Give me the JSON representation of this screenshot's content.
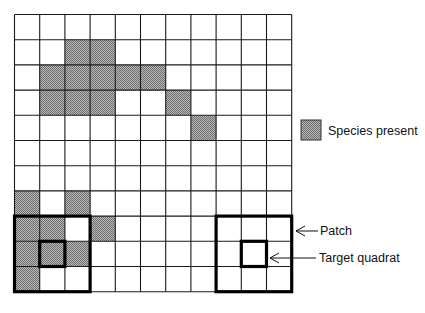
{
  "grid": {
    "rows": 11,
    "cols": 11,
    "line_color": "#1a1a1a",
    "shade_color": "#9a9a9a",
    "shaded_cells": [
      [
        1,
        2
      ],
      [
        1,
        3
      ],
      [
        2,
        1
      ],
      [
        2,
        2
      ],
      [
        2,
        3
      ],
      [
        2,
        4
      ],
      [
        2,
        5
      ],
      [
        3,
        1
      ],
      [
        3,
        2
      ],
      [
        3,
        3
      ],
      [
        3,
        6
      ],
      [
        4,
        7
      ],
      [
        7,
        0
      ],
      [
        7,
        2
      ],
      [
        8,
        0
      ],
      [
        8,
        1
      ],
      [
        8,
        3
      ],
      [
        9,
        0
      ],
      [
        9,
        1
      ],
      [
        9,
        2
      ],
      [
        10,
        0
      ]
    ]
  },
  "patches": [
    {
      "name": "left",
      "rows": [
        8,
        10
      ],
      "cols": [
        0,
        2
      ],
      "target": [
        9,
        1
      ]
    },
    {
      "name": "right",
      "rows": [
        8,
        10
      ],
      "cols": [
        8,
        10
      ],
      "target": [
        9,
        9
      ]
    }
  ],
  "legend": {
    "label": "Species present"
  },
  "annotations": {
    "patch_label": "Patch",
    "target_label": "Target quadrat"
  }
}
